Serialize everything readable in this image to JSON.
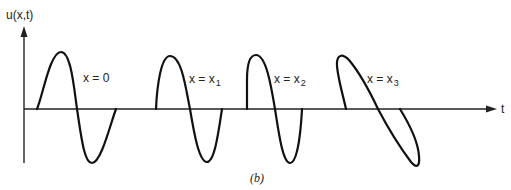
{
  "figure": {
    "y_axis_label": "u(x,t)",
    "x_axis_label": "t",
    "caption": "(b)",
    "colors": {
      "ink": "#111111",
      "background": "#ffffff"
    }
  },
  "waves": [
    {
      "label_main": "x = 0",
      "label_sub": ""
    },
    {
      "label_main": "x = x",
      "label_sub": "1"
    },
    {
      "label_main": "x = x",
      "label_sub": "2"
    },
    {
      "label_main": "x = x",
      "label_sub": "3"
    }
  ]
}
